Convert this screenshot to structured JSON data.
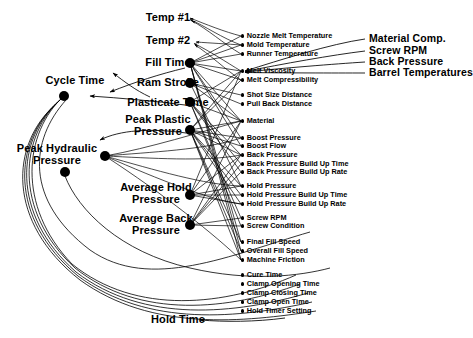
{
  "diagram": {
    "type": "influence-diagram",
    "colors": {
      "ink": "#000000",
      "background": "#ffffff"
    },
    "outputs": [
      {
        "id": "temp1",
        "label": "Temp #1",
        "x": 168,
        "y": 18,
        "node": null
      },
      {
        "id": "temp2",
        "label": "Temp #2",
        "x": 168,
        "y": 41,
        "node": null
      },
      {
        "id": "filltime",
        "label": "Fill Time",
        "x": 168,
        "y": 63,
        "node": {
          "x": 190,
          "y": 63
        }
      },
      {
        "id": "cycletime",
        "label": "Cycle Time",
        "x": 75,
        "y": 81,
        "node": {
          "x": 64,
          "y": 96
        }
      },
      {
        "id": "ramstroke",
        "label": "Ram Stroke",
        "x": 168,
        "y": 83,
        "node": {
          "x": 190,
          "y": 83
        }
      },
      {
        "id": "plasticate",
        "label": "Plasticate Time",
        "x": 168,
        "y": 103,
        "node": {
          "x": 190,
          "y": 102
        }
      },
      {
        "id": "peakplastic",
        "label": "Peak Plastic\nPressure",
        "x": 158,
        "y": 126,
        "node": {
          "x": 190,
          "y": 130
        }
      },
      {
        "id": "peakhyd",
        "label": "Peak Hydraulic\nPressure",
        "x": 57,
        "y": 155,
        "node": {
          "x": 65,
          "y": 172
        }
      },
      {
        "id": "peakhyd2",
        "label": "",
        "x": 0,
        "y": 0,
        "node": {
          "x": 105,
          "y": 156
        }
      },
      {
        "id": "avghold",
        "label": "Average Hold\nPressure",
        "x": 156,
        "y": 194,
        "node": {
          "x": 190,
          "y": 195
        }
      },
      {
        "id": "avgback",
        "label": "Average Back\nPressure",
        "x": 156,
        "y": 225,
        "node": {
          "x": 190,
          "y": 225
        }
      },
      {
        "id": "holdtime",
        "label": "Hold Time",
        "x": 178,
        "y": 320,
        "node": null
      }
    ],
    "intermediates": [
      {
        "id": "nozzle_melt_temp",
        "label": "Nozzle Melt Temperature",
        "y": 36
      },
      {
        "id": "mold_temp",
        "label": "Mold Temperature",
        "y": 45
      },
      {
        "id": "runner_temp",
        "label": "Runner Temperature",
        "y": 54
      },
      {
        "id": "melt_viscosity",
        "label": "Melt Viscosity",
        "y": 71
      },
      {
        "id": "melt_compress",
        "label": "Melt Compressibility",
        "y": 80
      },
      {
        "id": "shot_size_dist",
        "label": "Shot Size Distance",
        "y": 95
      },
      {
        "id": "pull_back_dist",
        "label": "Pull Back Distance",
        "y": 104
      },
      {
        "id": "material",
        "label": "Material",
        "y": 121
      },
      {
        "id": "boost_pressure",
        "label": "Boost Pressure",
        "y": 138
      },
      {
        "id": "boost_flow",
        "label": "Boost Flow",
        "y": 146
      },
      {
        "id": "back_pressure",
        "label": "Back Pressure",
        "y": 155
      },
      {
        "id": "bp_build_time",
        "label": "Back Pressure Build Up Time",
        "y": 164
      },
      {
        "id": "bp_build_rate",
        "label": "Back Pressure Build Up Rate",
        "y": 172
      },
      {
        "id": "hold_pressure",
        "label": "Hold Pressure",
        "y": 186
      },
      {
        "id": "hp_build_time",
        "label": "Hold Pressure Build Up Time",
        "y": 195
      },
      {
        "id": "hp_build_rate",
        "label": "Hold Pressure Build Up Rate",
        "y": 204
      },
      {
        "id": "screw_rpm",
        "label": "Screw RPM",
        "y": 218
      },
      {
        "id": "screw_condition",
        "label": "Screw Condition",
        "y": 226
      },
      {
        "id": "final_fill_speed",
        "label": "Final Fill Speed",
        "y": 242
      },
      {
        "id": "overall_fill_speed",
        "label": "Overall Fill Speed",
        "y": 251
      },
      {
        "id": "machine_friction",
        "label": "Machine Friction",
        "y": 260
      },
      {
        "id": "cure_time",
        "label": "Cure Time",
        "y": 275
      },
      {
        "id": "clamp_open_time_a",
        "label": "Clamp Opening Time",
        "y": 284
      },
      {
        "id": "clamp_close_time",
        "label": "Clamp Closing Time",
        "y": 293
      },
      {
        "id": "clamp_open_time_b",
        "label": "Clamp Open Time",
        "y": 302
      },
      {
        "id": "hold_timer_setting",
        "label": "Hold Timer Setting",
        "y": 311
      }
    ],
    "roots": [
      {
        "id": "material_comp",
        "label": "Material Comp.",
        "y": 39
      },
      {
        "id": "root_screw_rpm",
        "label": "Screw RPM",
        "y": 51
      },
      {
        "id": "root_back_pressure",
        "label": "Back Pressure",
        "y": 62
      },
      {
        "id": "barrel_temps",
        "label": "Barrel Temperatures",
        "y": 73
      }
    ]
  }
}
